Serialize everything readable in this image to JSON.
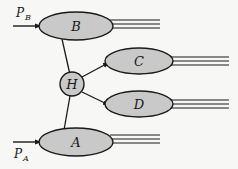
{
  "figure": {
    "kind": "parton-scattering-feynman-diagram",
    "background_color": "#f7f7f5",
    "line_color": "#1a1a1a",
    "blob_fill": "#c9c9c9",
    "blob_stroke": "#1a1a1a"
  },
  "blobs": {
    "B": {
      "label": "B",
      "cx": 76,
      "cy": 26,
      "rx": 37,
      "ry": 14
    },
    "A": {
      "label": "A",
      "cx": 76,
      "cy": 142,
      "rx": 37,
      "ry": 14
    },
    "C": {
      "label": "C",
      "cx": 139,
      "cy": 62,
      "rx": 34,
      "ry": 13
    },
    "D": {
      "label": "D",
      "cx": 139,
      "cy": 105,
      "rx": 34,
      "ry": 13
    },
    "H": {
      "label": "H",
      "cx": 72,
      "cy": 84,
      "rx": 12,
      "ry": 12
    }
  },
  "momenta": {
    "pb": {
      "base": "P",
      "sub": "B"
    },
    "pa": {
      "base": "P",
      "sub": "A"
    }
  },
  "incoming_arrows": {
    "pb_arrow": {
      "x1": 13,
      "y1": 26,
      "x2": 40,
      "y2": 26
    },
    "pa_arrow": {
      "x1": 13,
      "y1": 142,
      "x2": 40,
      "y2": 142
    }
  },
  "outgoing_jets": {
    "B_jet": {
      "count": 3,
      "x_start": 112,
      "x_end": 160,
      "y_center": 24,
      "spacing": 4
    },
    "A_jet": {
      "count": 3,
      "x_start": 112,
      "x_end": 160,
      "y_center": 139,
      "spacing": 4
    },
    "C_jet": {
      "count": 3,
      "x_start": 172,
      "x_end": 229,
      "y_center": 61,
      "spacing": 4
    },
    "D_jet": {
      "count": 3,
      "x_start": 172,
      "x_end": 229,
      "y_center": 104,
      "spacing": 4
    }
  },
  "connectors": {
    "B_to_H": {
      "x1": 62,
      "y1": 39,
      "x2": 69,
      "y2": 72
    },
    "A_to_H": {
      "x1": 64,
      "y1": 130,
      "x2": 70,
      "y2": 96
    },
    "H_to_C": {
      "x1": 82,
      "y1": 76,
      "x2": 108,
      "y2": 62
    },
    "H_to_D": {
      "x1": 82,
      "y1": 93,
      "x2": 108,
      "y2": 105
    }
  }
}
